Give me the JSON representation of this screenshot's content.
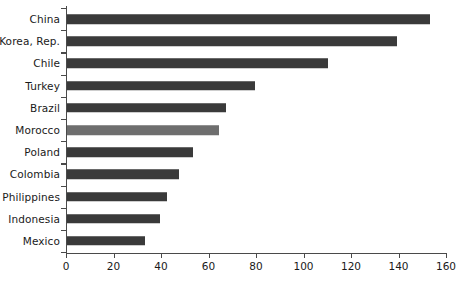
{
  "chart_data": {
    "type": "bar",
    "orientation": "horizontal",
    "title": "",
    "subtitle": "",
    "xlabel": "",
    "ylabel": "",
    "categories": [
      "China",
      "Korea, Rep.",
      "Chile",
      "Turkey",
      "Brazil",
      "Morocco",
      "Poland",
      "Colombia",
      "Philippines",
      "Indonesia",
      "Mexico"
    ],
    "values": [
      153,
      139,
      110,
      79,
      67,
      64,
      53,
      47,
      42,
      39,
      33
    ],
    "series": [
      {
        "name": "value",
        "values": [
          153,
          139,
          110,
          79,
          67,
          64,
          53,
          47,
          42,
          39,
          33
        ]
      }
    ],
    "highlighted_category": "Morocco",
    "xlim": [
      0,
      160
    ],
    "xticks": [
      0,
      20,
      40,
      60,
      80,
      100,
      120,
      140,
      160
    ],
    "xtick_labels": [
      "0",
      "20",
      "40",
      "60",
      "80",
      "100",
      "120",
      "140",
      "160"
    ],
    "grid": false,
    "legend": false,
    "legend_position": "none",
    "colors": {
      "bar": "#3a3a3a",
      "bar_highlight": "#6e6e6e",
      "axis": "#4a4a4a",
      "text": "#1a1a1a",
      "background": "#ffffff"
    }
  }
}
